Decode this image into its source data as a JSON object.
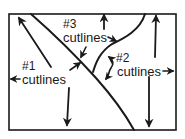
{
  "diagram": {
    "type": "photo-layout cutline placement diagram",
    "colors": {
      "ink": "#1a1a1a",
      "background": "#ffffff"
    },
    "labels": {
      "group1": {
        "number": "#1",
        "text": "cutlines"
      },
      "group2": {
        "number": "#2",
        "text": "cutlines"
      },
      "group3": {
        "number": "#3",
        "text": "cutlines"
      }
    },
    "regions": [
      {
        "id": "left-region",
        "label": "#1 cutlines"
      },
      {
        "id": "middle-region",
        "label": "#3 cutlines"
      },
      {
        "id": "right-region",
        "label": "#2 cutlines"
      }
    ],
    "arrows": [
      "up-left toward top-left corner (from #1)",
      "left to border (from #1 cutlines)",
      "down to bottom border (from #1)",
      "up-right to divider line (from #1)",
      "down-left to divider line (from #3)",
      "right to curved line (from #3)",
      "up to top border (above #3)",
      "double-headed curved arrow between lines (#2)",
      "right to border (from #2 cutlines)",
      "up to top border (from #2)",
      "down to bottom border (from #2)"
    ]
  }
}
